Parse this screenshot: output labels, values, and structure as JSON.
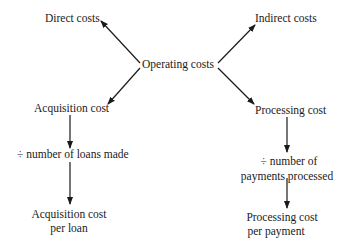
{
  "diagram": {
    "root": {
      "label": "Operating costs"
    },
    "top_left": {
      "label": "Direct costs"
    },
    "top_right": {
      "label": "Indirect costs"
    },
    "left_branch": {
      "label": "Acquisition cost",
      "divisor": "÷ number of loans made",
      "result_line1": "Acquisition cost",
      "result_line2": "per loan"
    },
    "right_branch": {
      "label": "Processing cost",
      "divisor_line1": "÷ number of",
      "divisor_line2": "payments processed",
      "result_line1": "Processing cost",
      "result_line2": "per payment"
    },
    "colors": {
      "ink": "#1a1a1a",
      "background": "#ffffff"
    }
  }
}
